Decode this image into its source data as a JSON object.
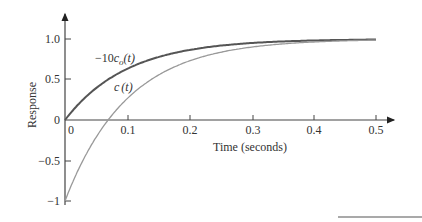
{
  "chart_data": {
    "type": "line",
    "title": "",
    "xlabel": "Time (seconds)",
    "ylabel": "Response",
    "xlim": [
      0,
      0.5
    ],
    "ylim": [
      -1,
      1.0
    ],
    "grid": false,
    "x_ticks": [
      "0",
      "0.1",
      "0.2",
      "0.3",
      "0.4",
      "0.5"
    ],
    "y_ticks": [
      "1.0",
      "0.5",
      "0",
      "−0.5",
      "−1"
    ],
    "x": [
      0,
      0.05,
      0.1,
      0.15,
      0.2,
      0.25,
      0.3,
      0.35,
      0.4,
      0.45,
      0.5
    ],
    "series": [
      {
        "name": "−10c_o(t)",
        "label_main": "−10",
        "label_var": "c",
        "label_sub": "o",
        "label_arg": "(t)",
        "color": "#555555",
        "values": [
          0,
          0.39,
          0.63,
          0.78,
          0.86,
          0.92,
          0.95,
          0.97,
          0.98,
          0.99,
          0.99
        ]
      },
      {
        "name": "c(t)",
        "label_main": "c",
        "label_arg": "(t)",
        "color": "#999999",
        "values": [
          -1,
          -0.21,
          0.26,
          0.55,
          0.73,
          0.84,
          0.9,
          0.94,
          0.96,
          0.98,
          0.99
        ]
      }
    ],
    "legend": "inline annotations"
  }
}
